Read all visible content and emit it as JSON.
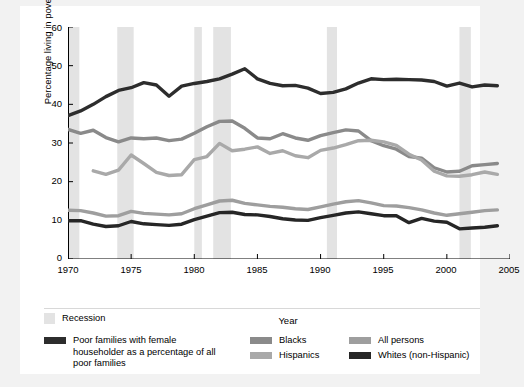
{
  "chart_data": {
    "type": "line",
    "title": "",
    "xlabel": "Year",
    "ylabel": "Percentage living in poverty",
    "xlim": [
      1970,
      2005
    ],
    "ylim": [
      0,
      60
    ],
    "yticks": [
      0,
      10,
      20,
      30,
      40,
      50,
      60
    ],
    "xticks": [
      1970,
      1975,
      1980,
      1985,
      1990,
      1995,
      2000,
      2005
    ],
    "grid": false,
    "legend_position": "below",
    "recession_label": "Recession",
    "recession_color": "#e3e3e3",
    "recession_bands": [
      {
        "start": 1969.9,
        "end": 1970.9
      },
      {
        "start": 1973.9,
        "end": 1975.2
      },
      {
        "start": 1980.0,
        "end": 1980.6
      },
      {
        "start": 1981.5,
        "end": 1982.9
      },
      {
        "start": 1990.5,
        "end": 1991.3
      },
      {
        "start": 2001.0,
        "end": 2001.9
      }
    ],
    "series": [
      {
        "name": "Poor families with female householder as a percentage of all poor families",
        "color": "#2d2d2d",
        "width": 3.4,
        "x": [
          1970,
          1971,
          1972,
          1973,
          1974,
          1975,
          1976,
          1977,
          1978,
          1979,
          1980,
          1981,
          1982,
          1983,
          1984,
          1985,
          1986,
          1987,
          1988,
          1989,
          1990,
          1991,
          1992,
          1993,
          1994,
          1995,
          1996,
          1997,
          1998,
          1999,
          2000,
          2001,
          2002,
          2003,
          2004
        ],
        "values": [
          37.1,
          38.3,
          40.0,
          42.0,
          43.6,
          44.3,
          45.6,
          45.0,
          42.1,
          44.7,
          45.4,
          45.9,
          46.6,
          47.8,
          49.2,
          46.6,
          45.4,
          44.8,
          44.9,
          44.2,
          42.8,
          43.1,
          44.0,
          45.5,
          46.6,
          46.4,
          46.5,
          46.4,
          46.3,
          45.9,
          44.7,
          45.5,
          44.5,
          45.0,
          44.8
        ]
      },
      {
        "name": "Blacks",
        "color": "#8a8a8a",
        "width": 3.4,
        "x": [
          1970,
          1971,
          1972,
          1973,
          1974,
          1975,
          1976,
          1977,
          1978,
          1979,
          1980,
          1981,
          1982,
          1983,
          1984,
          1985,
          1986,
          1987,
          1988,
          1989,
          1990,
          1991,
          1992,
          1993,
          1994,
          1995,
          1996,
          1997,
          1998,
          1999,
          2000,
          2001,
          2002,
          2003,
          2004
        ],
        "values": [
          33.5,
          32.5,
          33.3,
          31.4,
          30.3,
          31.3,
          31.1,
          31.3,
          30.6,
          31.0,
          32.5,
          34.2,
          35.6,
          35.7,
          33.8,
          31.3,
          31.1,
          32.4,
          31.3,
          30.7,
          31.9,
          32.7,
          33.4,
          33.1,
          30.6,
          29.3,
          28.4,
          26.5,
          26.1,
          23.6,
          22.5,
          22.7,
          24.1,
          24.4,
          24.7
        ]
      },
      {
        "name": "Hispanics",
        "color": "#a9a9a9",
        "width": 3.4,
        "x": [
          1972,
          1973,
          1974,
          1975,
          1976,
          1977,
          1978,
          1979,
          1980,
          1981,
          1982,
          1983,
          1984,
          1985,
          1986,
          1987,
          1988,
          1989,
          1990,
          1991,
          1992,
          1993,
          1994,
          1995,
          1996,
          1997,
          1998,
          1999,
          2000,
          2001,
          2002,
          2003,
          2004
        ],
        "values": [
          22.8,
          21.9,
          23.0,
          26.9,
          24.7,
          22.4,
          21.6,
          21.8,
          25.7,
          26.5,
          29.9,
          28.0,
          28.4,
          29.0,
          27.3,
          28.0,
          26.7,
          26.2,
          28.1,
          28.7,
          29.6,
          30.6,
          30.7,
          30.3,
          29.4,
          27.1,
          25.6,
          22.7,
          21.5,
          21.4,
          21.8,
          22.5,
          21.9
        ]
      },
      {
        "name": "All persons",
        "color": "#9e9e9e",
        "width": 3.4,
        "x": [
          1970,
          1971,
          1972,
          1973,
          1974,
          1975,
          1976,
          1977,
          1978,
          1979,
          1980,
          1981,
          1982,
          1983,
          1984,
          1985,
          1986,
          1987,
          1988,
          1989,
          1990,
          1991,
          1992,
          1993,
          1994,
          1995,
          1996,
          1997,
          1998,
          1999,
          2000,
          2001,
          2002,
          2003,
          2004
        ],
        "values": [
          12.6,
          12.5,
          11.9,
          11.1,
          11.2,
          12.3,
          11.8,
          11.6,
          11.4,
          11.7,
          13.0,
          14.0,
          15.0,
          15.2,
          14.4,
          14.0,
          13.6,
          13.4,
          13.0,
          12.8,
          13.5,
          14.2,
          14.8,
          15.1,
          14.5,
          13.8,
          13.7,
          13.3,
          12.7,
          11.9,
          11.3,
          11.7,
          12.1,
          12.5,
          12.7
        ]
      },
      {
        "name": "Whites (non-Hispanic)",
        "color": "#262626",
        "width": 3.4,
        "x": [
          1970,
          1971,
          1972,
          1973,
          1974,
          1975,
          1976,
          1977,
          1978,
          1979,
          1980,
          1981,
          1982,
          1983,
          1984,
          1985,
          1986,
          1987,
          1988,
          1989,
          1990,
          1991,
          1992,
          1993,
          1994,
          1995,
          1996,
          1997,
          1998,
          1999,
          2000,
          2001,
          2002,
          2003,
          2004
        ],
        "values": [
          9.9,
          9.9,
          9.0,
          8.4,
          8.6,
          9.7,
          9.1,
          8.9,
          8.7,
          9.0,
          10.2,
          11.1,
          12.0,
          12.1,
          11.5,
          11.4,
          11.0,
          10.4,
          10.1,
          10.0,
          10.7,
          11.3,
          11.9,
          12.2,
          11.7,
          11.2,
          11.2,
          9.4,
          10.5,
          9.8,
          9.5,
          7.8,
          8.0,
          8.2,
          8.6
        ]
      }
    ]
  },
  "legend": {
    "recession": {
      "label": "Recession",
      "color": "#e3e3e3"
    },
    "entries": [
      {
        "label": "Poor families with female householder as a percentage of all poor families",
        "color": "#2d2d2d"
      },
      {
        "label": "Blacks",
        "color": "#8a8a8a"
      },
      {
        "label": "Hispanics",
        "color": "#a9a9a9"
      },
      {
        "label": "All persons",
        "color": "#9e9e9e"
      },
      {
        "label": "Whites (non-Hispanic)",
        "color": "#262626"
      }
    ]
  },
  "axis": {
    "ylabel": "Percentage living in poverty",
    "xlabel": "Year",
    "yticks": [
      "0",
      "10",
      "20",
      "30",
      "40",
      "50",
      "60"
    ],
    "xticks": [
      "1970",
      "1975",
      "1980",
      "1985",
      "1990",
      "1995",
      "2000",
      "2005"
    ]
  }
}
